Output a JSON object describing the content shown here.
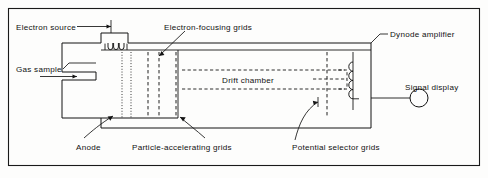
{
  "figure": {
    "kind": "schematic-diagram",
    "border_color": "#1a1a1a",
    "line_color": "#161616",
    "background": "#fdfdfc"
  },
  "labels": {
    "electron_source": "Electron source",
    "electron_focusing_grids": "Electron-focusing grids",
    "dynode_amplifier": "Dynode amplifier",
    "gas_sample": "Gas sample",
    "drift_chamber": "Drift chamber",
    "signal_display": "Signal display",
    "anode": "Anode",
    "particle_accelerating_grids": "Particle-accelerating grids",
    "potential_selector_grids": "Potential selector grids"
  },
  "components": {
    "filament_coil_loops": 3,
    "dynode_bumps": 4,
    "anode_dotted_lines": 2,
    "accelerating_grid_lines": 3,
    "potential_selector_lines": 2,
    "drift_chamber_dashed_lines": 2,
    "signal_display_shape": "circle"
  },
  "icons": {
    "gas_inlet_arrow": "arrow-right-icon",
    "electron_source_pointer": "arrow-right-icon",
    "focusing_grid_pointer": "arrow-down-left-icon",
    "anode_pointer": "arrow-up-right-icon",
    "accelerating_grid_pointer": "arrow-up-left-icon",
    "selector_grid_pointer": "arrow-right-icon",
    "display_node": "circle-icon"
  }
}
